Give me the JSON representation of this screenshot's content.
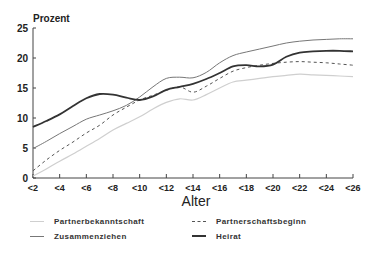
{
  "chart_data": {
    "type": "line",
    "title": "",
    "ylabel": "Prozent",
    "xlabel": "Alter",
    "ylim": [
      0,
      25
    ],
    "yticks": [
      0,
      5,
      10,
      15,
      20,
      25
    ],
    "xlim": [
      2,
      26
    ],
    "xtick_labels": [
      "<2",
      "<4",
      "<6",
      "<8",
      "<10",
      "<12",
      "<14",
      "<16",
      "<18",
      "<20",
      "<22",
      "<24",
      "<26"
    ],
    "x": [
      2,
      3,
      4,
      5,
      6,
      7,
      8,
      9,
      10,
      11,
      12,
      13,
      14,
      15,
      16,
      17,
      18,
      19,
      20,
      21,
      22,
      23,
      24,
      25,
      26
    ],
    "series": [
      {
        "name": "Partnerbekanntschaft",
        "style": "thin-light",
        "color": "#c8c8c8",
        "values": [
          0.3,
          1.5,
          2.8,
          4.0,
          5.3,
          6.6,
          8.0,
          9.1,
          10.2,
          11.5,
          12.6,
          13.2,
          13.0,
          13.9,
          15.0,
          16.0,
          16.3,
          16.6,
          16.9,
          17.1,
          17.3,
          17.2,
          17.1,
          17.0,
          16.9
        ]
      },
      {
        "name": "Partnerschaftsbeginn",
        "style": "dashed",
        "color": "#555555",
        "values": [
          1.2,
          3.0,
          4.6,
          6.0,
          7.5,
          8.8,
          10.5,
          11.8,
          13.0,
          13.8,
          14.6,
          15.2,
          14.3,
          15.3,
          16.6,
          17.8,
          18.4,
          18.8,
          19.1,
          19.3,
          19.4,
          19.3,
          19.2,
          19.0,
          18.8
        ]
      },
      {
        "name": "Zusammenziehen",
        "style": "thin",
        "color": "#777777",
        "values": [
          4.9,
          6.1,
          7.4,
          8.6,
          9.8,
          10.5,
          11.2,
          12.1,
          13.5,
          15.2,
          16.6,
          16.8,
          16.7,
          17.6,
          19.2,
          20.4,
          21.0,
          21.5,
          22.0,
          22.5,
          22.8,
          23.0,
          23.1,
          23.2,
          23.2
        ]
      },
      {
        "name": "Heirat",
        "style": "thick",
        "color": "#333333",
        "values": [
          8.5,
          9.5,
          10.6,
          12.0,
          13.3,
          14.0,
          13.9,
          13.4,
          13.0,
          13.6,
          14.7,
          15.2,
          15.7,
          16.5,
          17.5,
          18.6,
          18.8,
          18.6,
          18.9,
          20.2,
          20.9,
          21.1,
          21.2,
          21.2,
          21.1
        ]
      }
    ],
    "legend_position": "bottom",
    "grid": false
  },
  "legend": {
    "items": [
      {
        "label": "Partnerbekanntschaft"
      },
      {
        "label": "Partnerschaftsbeginn"
      },
      {
        "label": "Zusammenziehen"
      },
      {
        "label": "Heirat"
      }
    ]
  }
}
